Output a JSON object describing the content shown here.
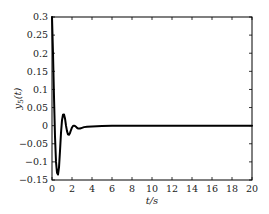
{
  "chart_data": {
    "type": "line",
    "title": "",
    "xlabel": "t/s",
    "ylabel": "y5(t)",
    "ylabel_main": "y",
    "ylabel_sub": "5",
    "ylabel_arg": "(t)",
    "xlim": [
      0,
      20
    ],
    "ylim": [
      -0.15,
      0.3
    ],
    "xticks": [
      0,
      2,
      4,
      6,
      8,
      10,
      12,
      14,
      16,
      18,
      20
    ],
    "xtick_labels": [
      "0",
      "2",
      "4",
      "6",
      "8",
      "10",
      "12",
      "14",
      "16",
      "18",
      "20"
    ],
    "yticks": [
      -0.15,
      -0.1,
      -0.05,
      0,
      0.05,
      0.1,
      0.15,
      0.2,
      0.25,
      0.3
    ],
    "ytick_labels": [
      "−0.15",
      "−0.1",
      "−0.05",
      "0",
      "0.05",
      "0.1",
      "0.15",
      "0.2",
      "0.25",
      "0.3"
    ],
    "grid": false,
    "legend": null,
    "series": [
      {
        "name": "y5(t)",
        "color": "#000000",
        "x": [
          0,
          0.1,
          0.2,
          0.3,
          0.4,
          0.5,
          0.6,
          0.7,
          0.8,
          0.9,
          1.0,
          1.1,
          1.2,
          1.3,
          1.4,
          1.5,
          1.6,
          1.7,
          1.8,
          1.9,
          2.0,
          2.1,
          2.2,
          2.3,
          2.4,
          2.5,
          2.6,
          2.8,
          3.0,
          3.2,
          3.5,
          4.0,
          5.0,
          6.0,
          8.0,
          10.0,
          12.0,
          14.0,
          16.0,
          18.0,
          20.0
        ],
        "y": [
          0.3,
          0.2,
          0.08,
          -0.03,
          -0.1,
          -0.13,
          -0.135,
          -0.115,
          -0.07,
          -0.02,
          0.015,
          0.03,
          0.031,
          0.02,
          0.0,
          -0.015,
          -0.024,
          -0.025,
          -0.02,
          -0.012,
          -0.005,
          -0.001,
          0.0,
          -0.001,
          -0.003,
          -0.006,
          -0.008,
          -0.008,
          -0.006,
          -0.004,
          -0.003,
          -0.002,
          -0.001,
          0.0,
          0.0,
          0.0,
          0.0,
          0.0,
          0.0,
          0.0,
          0.0
        ]
      }
    ]
  }
}
